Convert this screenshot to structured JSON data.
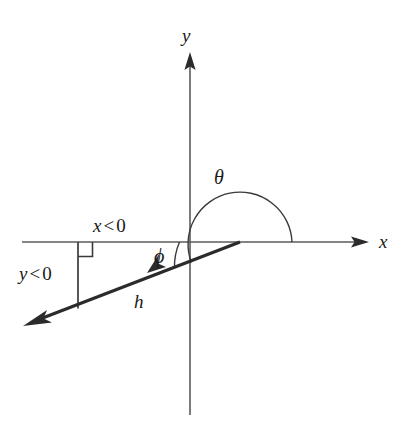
{
  "figure": {
    "type": "geometry-diagram",
    "background_color": "#ffffff",
    "ink_color": "#2b2b2b",
    "axis_color": "#5b5b5b"
  },
  "axes": {
    "y_label": "y",
    "x_label": "x",
    "origin": {
      "x": 190,
      "y": 242
    },
    "x_axis": {
      "x1": 22,
      "y1": 242,
      "x2": 368,
      "y2": 242
    },
    "y_axis": {
      "x1": 190,
      "y1": 55,
      "x2": 190,
      "y2": 415
    }
  },
  "labels": {
    "theta": "θ",
    "phi": "ϕ",
    "hypotenuse": "h",
    "x_negative_left": "x",
    "x_negative_op": "<",
    "x_negative_value": "0",
    "y_negative_left": "y",
    "y_negative_op": "<",
    "y_negative_value": "0"
  },
  "ray": {
    "name": "h",
    "from": {
      "x": 240,
      "y": 242
    },
    "to": {
      "x": 25,
      "y": 325
    },
    "arrowhead": "left-down"
  },
  "components": {
    "vertical_drop": {
      "x": 78,
      "y_top": 242,
      "y_bottom": 308
    },
    "right_angle_marker": {
      "x": 78,
      "y": 242,
      "size": 14
    }
  },
  "angles": {
    "theta": {
      "symbol": "θ",
      "vertex": {
        "x": 240,
        "y": 242
      },
      "radius": 52,
      "from_degrees": 0,
      "to_degrees": 201,
      "direction": "counterclockwise",
      "label_position": {
        "x": 222,
        "y": 178
      }
    },
    "phi": {
      "symbol": "ϕ",
      "vertex": {
        "x": 240,
        "y": 242
      },
      "radius": 62,
      "from_degrees": 180,
      "to_degrees": 201,
      "label_position": {
        "x": 161,
        "y": 256
      }
    }
  }
}
